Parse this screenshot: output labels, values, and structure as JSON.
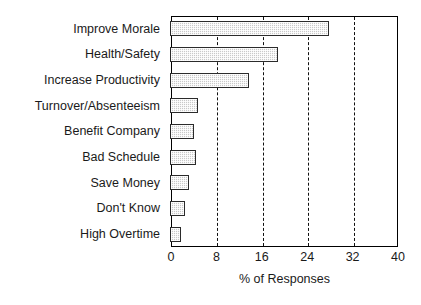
{
  "chart_data": {
    "type": "bar",
    "orientation": "horizontal",
    "title": "",
    "xlabel": "% of Responses",
    "ylabel": "",
    "categories": [
      "Improve Morale",
      "Health/Safety",
      "Increase Productivity",
      "Turnover/Absenteeism",
      "Benefit Company",
      "Bad Schedule",
      "Save Money",
      "Don't Know",
      "High Overtime"
    ],
    "values": [
      28,
      19,
      14,
      5,
      4.2,
      4.5,
      3.3,
      2.6,
      2
    ],
    "xlim": [
      0,
      40
    ],
    "xticks": [
      0,
      8,
      16,
      24,
      32,
      40
    ],
    "xtick_labels": [
      "0",
      "8",
      "16",
      "24",
      "32",
      "40"
    ],
    "gridlines": [
      8,
      16,
      24,
      32
    ],
    "grid": true,
    "legend": "none",
    "bar_fill_color": "#c9c9c9",
    "bar_border_color": "#2b2b2b",
    "axis_color": "#000000"
  }
}
